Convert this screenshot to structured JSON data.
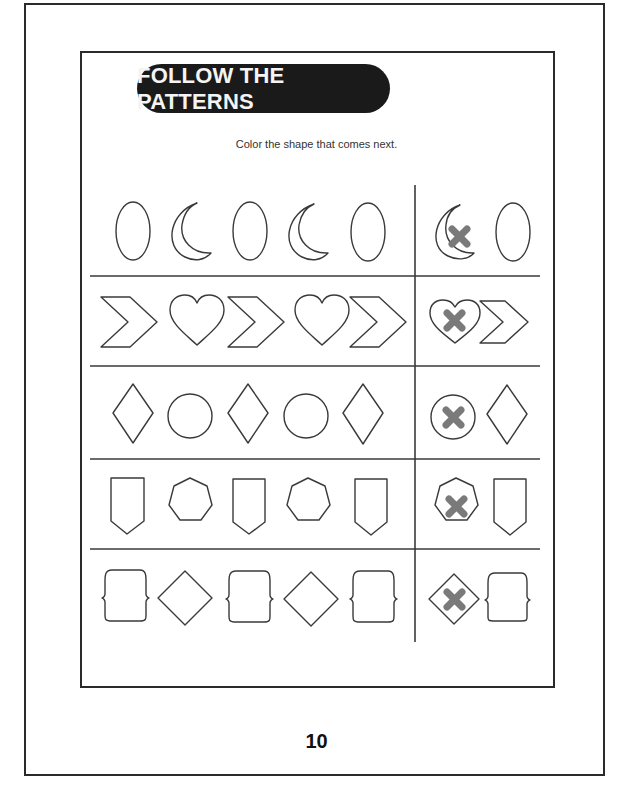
{
  "worksheet": {
    "title": "FOLLOW THE PATTERNS",
    "instruction": "Color the shape that comes next.",
    "page_number": "10",
    "colors": {
      "line": "#3a3a3a",
      "title_bg": "#1a1a1a",
      "title_text": "#f4f4f4",
      "mark": "#7a7a7a"
    },
    "rows": [
      {
        "sequence": [
          "oval",
          "crescent",
          "oval",
          "crescent",
          "oval"
        ],
        "choices": [
          {
            "shape": "crescent",
            "marked": true
          },
          {
            "shape": "oval",
            "marked": false
          }
        ]
      },
      {
        "sequence": [
          "chevron",
          "heart",
          "chevron",
          "heart",
          "chevron"
        ],
        "choices": [
          {
            "shape": "heart",
            "marked": true
          },
          {
            "shape": "chevron",
            "marked": false
          }
        ]
      },
      {
        "sequence": [
          "rhombus",
          "circle",
          "rhombus",
          "circle",
          "rhombus"
        ],
        "choices": [
          {
            "shape": "circle",
            "marked": true
          },
          {
            "shape": "rhombus",
            "marked": false
          }
        ]
      },
      {
        "sequence": [
          "pentagon-banner",
          "heptagon",
          "pentagon-banner",
          "heptagon",
          "pentagon-banner"
        ],
        "choices": [
          {
            "shape": "heptagon",
            "marked": true
          },
          {
            "shape": "pentagon-banner",
            "marked": false
          }
        ]
      },
      {
        "sequence": [
          "bracket-square",
          "diamond",
          "bracket-square",
          "diamond",
          "bracket-square"
        ],
        "choices": [
          {
            "shape": "diamond",
            "marked": true
          },
          {
            "shape": "bracket-square",
            "marked": false
          }
        ]
      }
    ]
  }
}
